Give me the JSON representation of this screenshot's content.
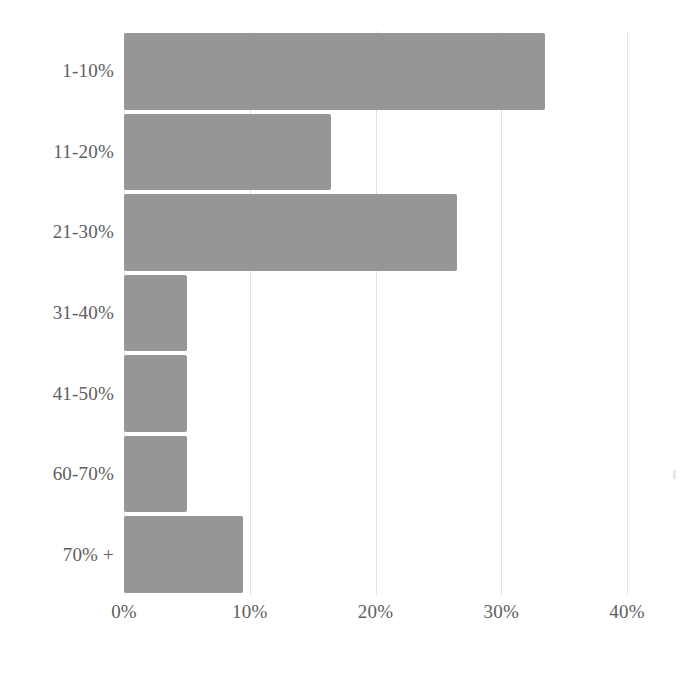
{
  "chart_data": {
    "type": "bar",
    "orientation": "horizontal",
    "title": "",
    "xlabel": "",
    "ylabel": "",
    "categories": [
      "1-10%",
      "11-20%",
      "21-30%",
      "31-40%",
      "41-50%",
      "60-70%",
      "70% +"
    ],
    "values": [
      33.5,
      16.5,
      26.5,
      5.0,
      5.0,
      5.0,
      9.5
    ],
    "xlim": [
      0,
      40
    ],
    "x_ticks": [
      0,
      10,
      20,
      30,
      40
    ],
    "x_tick_labels": [
      "0%",
      "10%",
      "20%",
      "30%",
      "40%"
    ],
    "grid": "vertical",
    "legend": "none",
    "bar_color": "#969696",
    "gridline_color": "#e2e2e2",
    "label_color": "#5e5e5e"
  }
}
